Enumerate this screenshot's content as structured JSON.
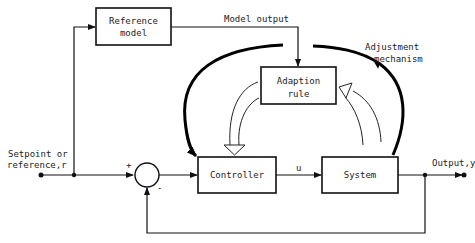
{
  "diagram": {
    "blocks": {
      "reference_model": [
        "Reference",
        "model"
      ],
      "adaption_rule": [
        "Adaption",
        "rule"
      ],
      "controller": "Controller",
      "system": "System"
    },
    "labels": {
      "model_output": "Model output",
      "adjustment_mechanism": [
        "Adjustment",
        "mechanism"
      ],
      "setpoint": [
        "Setpoint or",
        "reference,r"
      ],
      "control_signal": "u",
      "output": "Output,y",
      "plus_sign": "+",
      "minus_sign": "-"
    },
    "colors": {
      "stroke": "#111111",
      "background": "#ffffff"
    }
  }
}
